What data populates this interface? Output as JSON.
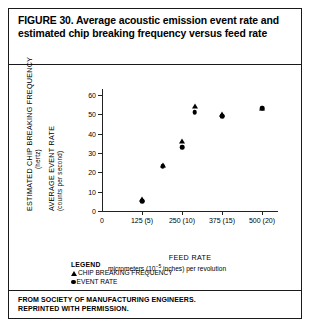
{
  "figure": {
    "title": "FIGURE 30. Average acoustic emission event rate and estimated chip breaking frequency versus feed rate",
    "source_line1": "FROM SOCIETY OF MANUFACTURING ENGINEERS.",
    "source_line2": "REPRINTED WITH PERMISSION."
  },
  "legend": {
    "heading": "LEGEND",
    "entries": [
      {
        "marker": "triangle-marker",
        "label": "CHIP BREAKING FREQUENCY"
      },
      {
        "marker": "circle-marker",
        "label": "EVENT RATE"
      }
    ]
  },
  "axis_titles": {
    "y_primary": "ESTIMATED CHIP BREAKING FREQUENCY",
    "y_primary_unit": "(hertz)",
    "y_secondary": "AVERAGE EVENT RATE",
    "y_secondary_unit": "(counts per second)",
    "x_main": "FEED RATE",
    "x_sub_prefix": "micrometers (10",
    "x_sub_exponent": "−5",
    "x_sub_suffix": " inches) per revolution"
  },
  "chart_data": {
    "type": "scatter",
    "title": "Average acoustic emission event rate and estimated chip breaking frequency versus feed rate",
    "xlabel": "FEED RATE — micrometers (10^-5 inches) per revolution",
    "ylabel": "ESTIMATED CHIP BREAKING FREQUENCY (hertz) / AVERAGE EVENT RATE (counts per second)",
    "xlim": [
      0,
      550
    ],
    "ylim": [
      0,
      63
    ],
    "grid": false,
    "legend_position": "below-plot-left",
    "x_ticks": [
      {
        "value": 0,
        "label": "0"
      },
      {
        "value": 125,
        "label": "125 (5)"
      },
      {
        "value": 250,
        "label": "250 (10)"
      },
      {
        "value": 375,
        "label": "375 (15)"
      },
      {
        "value": 500,
        "label": "500 (20)"
      }
    ],
    "y_ticks": [
      {
        "value": 0,
        "label": "0"
      },
      {
        "value": 10,
        "label": "10"
      },
      {
        "value": 20,
        "label": "20"
      },
      {
        "value": 30,
        "label": "30"
      },
      {
        "value": 40,
        "label": "40"
      },
      {
        "value": 50,
        "label": "50"
      },
      {
        "value": 60,
        "label": "60"
      }
    ],
    "series": [
      {
        "name": "CHIP BREAKING FREQUENCY",
        "marker": "triangle",
        "color": "#000000",
        "points": [
          {
            "x": 125,
            "y": 6
          },
          {
            "x": 190,
            "y": 24
          },
          {
            "x": 250,
            "y": 36
          },
          {
            "x": 290,
            "y": 54
          },
          {
            "x": 375,
            "y": 50
          },
          {
            "x": 500,
            "y": 53
          }
        ]
      },
      {
        "name": "EVENT RATE",
        "marker": "circle",
        "color": "#000000",
        "points": [
          {
            "x": 125,
            "y": 5
          },
          {
            "x": 190,
            "y": 23
          },
          {
            "x": 250,
            "y": 33
          },
          {
            "x": 290,
            "y": 51
          },
          {
            "x": 375,
            "y": 49
          },
          {
            "x": 500,
            "y": 53
          }
        ]
      }
    ]
  }
}
